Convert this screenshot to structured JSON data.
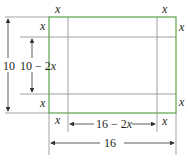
{
  "diagram": {
    "colors": {
      "outer": "#5aa34a",
      "inner": "#9a9a9a",
      "dim": "#555555",
      "text": "#231f20"
    },
    "labels": {
      "x_top_left": "x",
      "x_top_right": "x",
      "x_left_top": "x",
      "x_right_top": "x",
      "x_left_bottom": "x",
      "x_right_bottom": "x",
      "x_bottom_left": "x",
      "x_bottom_right": "x",
      "height_outer": "10",
      "height_inner": "10 − 2x",
      "width_inner": "16 − 2x",
      "width_outer": "16"
    }
  }
}
